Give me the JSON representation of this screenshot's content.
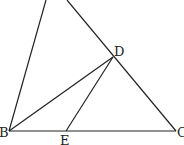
{
  "diagram": {
    "type": "geometry",
    "points": {
      "A": {
        "x": 49,
        "y": -8,
        "label": ""
      },
      "B": {
        "x": 9,
        "y": 131,
        "label": "B"
      },
      "C": {
        "x": 176,
        "y": 131,
        "label": "C"
      },
      "D": {
        "x": 113,
        "y": 57,
        "label": "D"
      },
      "E": {
        "x": 66,
        "y": 131,
        "label": "E"
      }
    },
    "segments": [
      {
        "name": "AB",
        "from": "A",
        "to": "B"
      },
      {
        "name": "AC",
        "from": "A",
        "to": "C"
      },
      {
        "name": "BC",
        "from": "B",
        "to": "C"
      },
      {
        "name": "BD",
        "from": "B",
        "to": "D"
      },
      {
        "name": "DE",
        "from": "D",
        "to": "E"
      }
    ],
    "labels": {
      "B": "B",
      "C": "C",
      "D": "D",
      "E": "E"
    },
    "stroke_color": "#222222"
  }
}
